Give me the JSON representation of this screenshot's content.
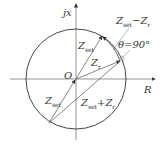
{
  "diagram": {
    "axes": {
      "x_label": "R",
      "y_label": "jx",
      "origin_label": "O"
    },
    "labels": {
      "zset_upper": {
        "main": "Z",
        "sub": "set"
      },
      "zset_lower": {
        "main": "Z",
        "sub": "set"
      },
      "zr": {
        "main": "Z",
        "sub": "r"
      },
      "diff_main1": "Z",
      "diff_sub1": "set",
      "diff_op": "−",
      "diff_main2": "Z",
      "diff_sub2": "r",
      "sum_main1": "Z",
      "sum_sub1": "set",
      "sum_op": "+",
      "sum_main2": "Z",
      "sum_sub2": "r",
      "angle": "θ=90°"
    },
    "colors": {
      "line": "#444444",
      "background": "#ffffff"
    }
  }
}
